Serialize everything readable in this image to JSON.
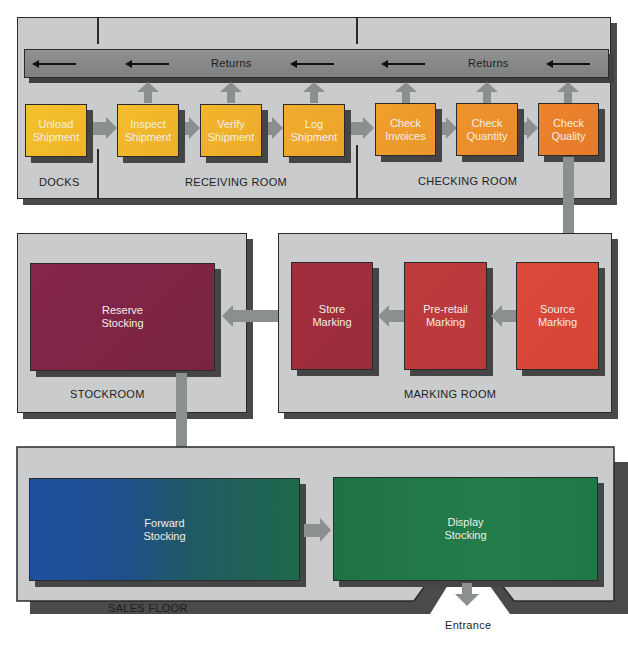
{
  "diagram": {
    "type": "flowchart",
    "title": "",
    "colors": {
      "panel": "#c9cbcc",
      "returns_bar": "#858788",
      "arrow": "#8c8f90",
      "yellow": "#f1b72a",
      "orange": "#ec8a2a",
      "red": "#d94a3a",
      "crimson": "#a8303a",
      "maroon": "#7e2545",
      "blue": "#1d4f9a",
      "green": "#1f7a45"
    },
    "top_panel": {
      "returns_labels": [
        "Returns",
        "Returns"
      ],
      "rooms": [
        {
          "label": "DOCKS"
        },
        {
          "label": "RECEIVING ROOM"
        },
        {
          "label": "CHECKING ROOM"
        }
      ],
      "steps": [
        {
          "label": "Unload\nShipment",
          "room": "DOCKS"
        },
        {
          "label": "Inspect\nShipment",
          "room": "RECEIVING ROOM"
        },
        {
          "label": "Verify\nShipment",
          "room": "RECEIVING ROOM"
        },
        {
          "label": "Log\nShipment",
          "room": "RECEIVING ROOM"
        },
        {
          "label": "Check\nInvoices",
          "room": "CHECKING ROOM"
        },
        {
          "label": "Check\nQuantity",
          "room": "CHECKING ROOM"
        },
        {
          "label": "Check\nQuality",
          "room": "CHECKING ROOM"
        }
      ]
    },
    "stockroom": {
      "label": "STOCKROOM",
      "steps": [
        {
          "label": "Reserve\nStocking"
        }
      ]
    },
    "marking_room": {
      "label": "MARKING ROOM",
      "steps": [
        {
          "label": "Store\nMarking"
        },
        {
          "label": "Pre-retail\nMarking"
        },
        {
          "label": "Source\nMarking"
        }
      ]
    },
    "sales_floor": {
      "label": "SALES FLOOR",
      "steps": [
        {
          "label": "Forward\nStocking"
        },
        {
          "label": "Display\nStocking"
        }
      ],
      "exit_label": "Entrance"
    },
    "flow": [
      "Unload Shipment -> Inspect Shipment",
      "Inspect Shipment -> Verify Shipment",
      "Verify Shipment -> Log Shipment",
      "Log Shipment -> Check Invoices",
      "Check Invoices -> Check Quantity",
      "Check Quantity -> Check Quality",
      "Check Quality -> Source Marking",
      "Source Marking -> Pre-retail Marking",
      "Pre-retail Marking -> Store Marking",
      "Store Marking -> Reserve Stocking",
      "Reserve Stocking -> Forward Stocking",
      "Forward Stocking -> Display Stocking",
      "Display Stocking -> Entrance",
      "Inspect/Verify/Log Shipment, Check Invoices/Quantity/Quality -> Returns"
    ]
  }
}
